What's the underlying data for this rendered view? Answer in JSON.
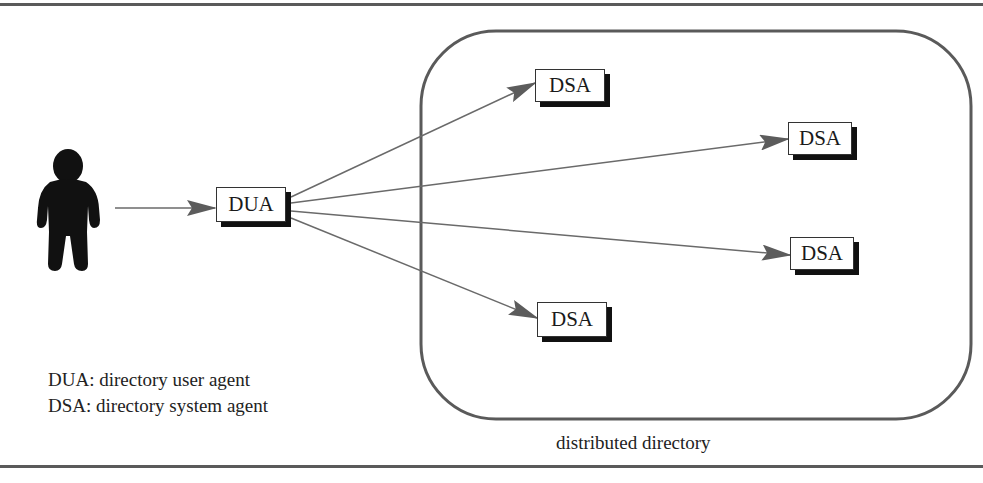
{
  "diagram": {
    "nodes": {
      "user": {
        "label": "user",
        "icon": "person-silhouette-icon"
      },
      "dua": {
        "label": "DUA"
      },
      "dsa": [
        {
          "label": "DSA"
        },
        {
          "label": "DSA"
        },
        {
          "label": "DSA"
        },
        {
          "label": "DSA"
        }
      ]
    },
    "region": {
      "label": "distributed directory"
    },
    "edges": [
      {
        "from": "user",
        "to": "DUA"
      },
      {
        "from": "DUA",
        "to": "DSA-1"
      },
      {
        "from": "DUA",
        "to": "DSA-2"
      },
      {
        "from": "DUA",
        "to": "DSA-3"
      },
      {
        "from": "DUA",
        "to": "DSA-4"
      }
    ],
    "legend": [
      "DUA: directory user agent",
      "DSA: directory system agent"
    ],
    "colors": {
      "lines": "#6a6a6a",
      "arrowheads": "#5c5c5c",
      "region_border": "#5a5a5a",
      "box_shadow": "#111111",
      "silhouette": "#111111"
    }
  }
}
